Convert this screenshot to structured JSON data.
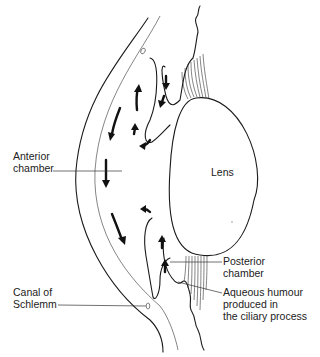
{
  "diagram": {
    "colors": {
      "line": "#1a1a1a",
      "text": "#222222",
      "background": "#ffffff"
    },
    "center_label": "Lens",
    "labels": {
      "anterior_chamber": [
        "Anterior",
        "chamber"
      ],
      "canal_of_schlemm": [
        "Canal of",
        "Schlemm"
      ],
      "posterior_chamber": [
        "Posterior",
        "chamber"
      ],
      "aqueous_humour": [
        "Aqueous humour",
        "produced in",
        "the ciliary process"
      ]
    }
  }
}
